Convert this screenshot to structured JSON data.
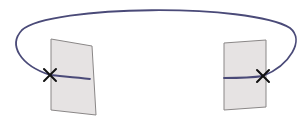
{
  "diagram": {
    "colors": {
      "background": "#ffffff",
      "sheet_fill": "#e6e3e3",
      "sheet_stroke": "#8a8787",
      "curve": "#4a4a78",
      "cross": "#111111"
    },
    "sheets": [
      {
        "name": "left-sheet",
        "points": "51,39 92,46 96,115 51,110"
      },
      {
        "name": "right-sheet",
        "points": "224,43 266,40 266,107 224,110"
      }
    ],
    "curve_path": "M 90 79 C 72 77, 58 76, 50 75 C 20 65, 8 45, 22 30 C 50 5, 250 3, 290 28 C 305 40, 290 65, 263 76 C 250 78, 235 78, 224 78",
    "crosses": [
      {
        "name": "left-cross",
        "x": 50,
        "y": 75
      },
      {
        "name": "right-cross",
        "x": 263,
        "y": 76
      }
    ]
  }
}
